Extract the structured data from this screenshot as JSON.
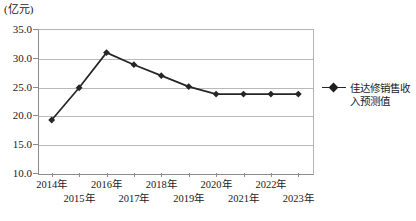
{
  "chart_data": {
    "type": "line",
    "title": "",
    "subtitle": "",
    "unit_label": "(亿元)",
    "xlabel": "",
    "ylabel": "",
    "categories": [
      "2014年",
      "2015年",
      "2016年",
      "2017年",
      "2018年",
      "2019年",
      "2020年",
      "2021年",
      "2022年",
      "2023年"
    ],
    "series": [
      {
        "name": "佳达修销售收入预测值",
        "values": [
          19.2,
          24.8,
          30.9,
          28.8,
          26.9,
          25.0,
          23.7,
          23.7,
          23.7,
          23.7
        ]
      }
    ],
    "ylim": [
      10.0,
      35.0
    ],
    "yticks": [
      "10.0",
      "15.0",
      "20.0",
      "25.0",
      "30.0",
      "35.0"
    ],
    "ytick_values": [
      10.0,
      15.0,
      20.0,
      25.0,
      30.0,
      35.0
    ],
    "grid": true,
    "legend_position": "right",
    "marker": "diamond",
    "line_color": "#262626"
  },
  "legend": {
    "entries": [
      {
        "label": "佳达修销售收入预测值"
      }
    ]
  }
}
